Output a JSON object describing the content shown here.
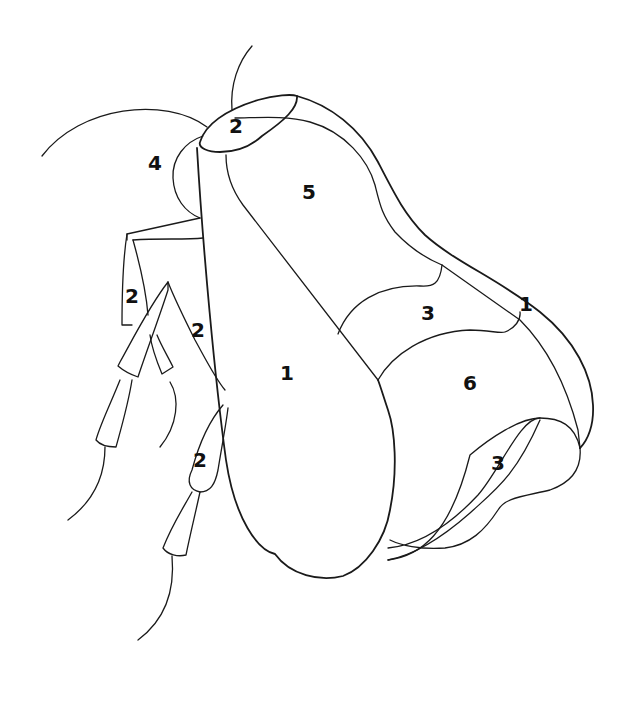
{
  "figure": {
    "stroke_color": "#1a1a1a",
    "background": "#ffffff",
    "labels": [
      {
        "id": "head-cap",
        "text": "2",
        "x": 236,
        "y": 126
      },
      {
        "id": "eye-region",
        "text": "4",
        "x": 155,
        "y": 163
      },
      {
        "id": "upper-back",
        "text": "5",
        "x": 309,
        "y": 192
      },
      {
        "id": "left-appendage-upper",
        "text": "2",
        "x": 132,
        "y": 296
      },
      {
        "id": "middle-appendage",
        "text": "2",
        "x": 198,
        "y": 330
      },
      {
        "id": "main-body",
        "text": "1",
        "x": 287,
        "y": 373
      },
      {
        "id": "middle-band",
        "text": "3",
        "x": 428,
        "y": 313
      },
      {
        "id": "outer-rim",
        "text": "1",
        "x": 526,
        "y": 304
      },
      {
        "id": "lower-segment",
        "text": "6",
        "x": 470,
        "y": 383
      },
      {
        "id": "lower-lobe",
        "text": "3",
        "x": 498,
        "y": 463
      },
      {
        "id": "lower-appendage",
        "text": "2",
        "x": 200,
        "y": 460
      }
    ]
  }
}
